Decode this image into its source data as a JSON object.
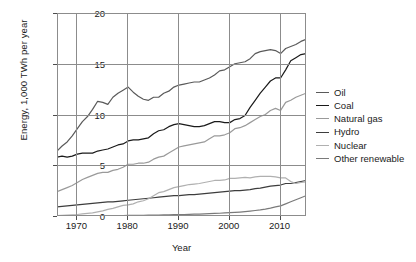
{
  "chart_data": {
    "type": "line",
    "title": "",
    "xlabel": "Year",
    "ylabel": "Energy, 1,000 TWh per year",
    "xlim": [
      1965,
      2014
    ],
    "ylim": [
      0,
      20
    ],
    "xticks": [
      1970,
      1980,
      1990,
      2000,
      2010
    ],
    "yticks": [
      0,
      5,
      10,
      15,
      20
    ],
    "grid": true,
    "legend_position": "right",
    "x": [
      1965,
      1966,
      1967,
      1968,
      1969,
      1970,
      1971,
      1972,
      1973,
      1974,
      1975,
      1976,
      1977,
      1978,
      1979,
      1980,
      1981,
      1982,
      1983,
      1984,
      1985,
      1986,
      1987,
      1988,
      1989,
      1990,
      1991,
      1992,
      1993,
      1994,
      1995,
      1996,
      1997,
      1998,
      1999,
      2000,
      2001,
      2002,
      2003,
      2004,
      2005,
      2006,
      2007,
      2008,
      2009,
      2010,
      2011,
      2012,
      2013,
      2014
    ],
    "series": [
      {
        "name": "Oil",
        "color": "#5a5a5a",
        "values": [
          6.4,
          6.9,
          7.3,
          7.9,
          8.6,
          9.3,
          9.8,
          10.5,
          11.3,
          11.2,
          11.0,
          11.7,
          12.1,
          12.4,
          12.7,
          12.2,
          11.8,
          11.5,
          11.4,
          11.7,
          11.7,
          12.1,
          12.3,
          12.7,
          12.9,
          13.0,
          13.1,
          13.2,
          13.2,
          13.4,
          13.6,
          13.9,
          14.3,
          14.4,
          14.7,
          15.0,
          15.1,
          15.2,
          15.5,
          16.0,
          16.2,
          16.3,
          16.4,
          16.3,
          16.0,
          16.5,
          16.7,
          16.9,
          17.2,
          17.4
        ]
      },
      {
        "name": "Coal",
        "color": "#1a1a1a",
        "values": [
          5.8,
          5.9,
          5.8,
          5.9,
          6.1,
          6.2,
          6.2,
          6.2,
          6.4,
          6.5,
          6.6,
          6.8,
          7.0,
          7.1,
          7.4,
          7.5,
          7.5,
          7.6,
          7.7,
          8.1,
          8.4,
          8.5,
          8.8,
          9.0,
          9.1,
          9.0,
          8.9,
          8.8,
          8.8,
          8.9,
          9.1,
          9.3,
          9.3,
          9.2,
          9.2,
          9.5,
          9.6,
          9.9,
          10.7,
          11.4,
          12.1,
          12.7,
          13.3,
          13.6,
          13.6,
          14.4,
          15.3,
          15.6,
          15.9,
          16.0
        ]
      },
      {
        "name": "Natural gas",
        "color": "#9a9a9a",
        "values": [
          2.4,
          2.6,
          2.8,
          3.0,
          3.3,
          3.6,
          3.8,
          4.0,
          4.2,
          4.3,
          4.3,
          4.5,
          4.6,
          4.8,
          5.1,
          5.1,
          5.2,
          5.2,
          5.3,
          5.6,
          5.8,
          5.9,
          6.2,
          6.5,
          6.8,
          6.9,
          7.0,
          7.1,
          7.2,
          7.3,
          7.6,
          7.9,
          7.9,
          8.0,
          8.2,
          8.6,
          8.7,
          8.9,
          9.2,
          9.5,
          9.8,
          10.0,
          10.4,
          10.6,
          10.4,
          11.2,
          11.4,
          11.7,
          11.9,
          12.1
        ]
      },
      {
        "name": "Hydro",
        "color": "#3d3d3d",
        "values": [
          0.9,
          0.95,
          1.0,
          1.05,
          1.1,
          1.15,
          1.2,
          1.25,
          1.3,
          1.35,
          1.4,
          1.4,
          1.45,
          1.5,
          1.55,
          1.6,
          1.65,
          1.7,
          1.75,
          1.8,
          1.85,
          1.9,
          1.95,
          2.0,
          2.0,
          2.05,
          2.1,
          2.1,
          2.15,
          2.2,
          2.25,
          2.3,
          2.35,
          2.4,
          2.45,
          2.5,
          2.5,
          2.55,
          2.6,
          2.7,
          2.75,
          2.85,
          2.95,
          3.0,
          3.05,
          3.2,
          3.2,
          3.3,
          3.4,
          3.5
        ]
      },
      {
        "name": "Nuclear",
        "color": "#b0b0b0",
        "values": [
          0.05,
          0.07,
          0.09,
          0.12,
          0.15,
          0.2,
          0.25,
          0.3,
          0.4,
          0.5,
          0.65,
          0.75,
          0.9,
          1.05,
          1.1,
          1.2,
          1.4,
          1.5,
          1.7,
          2.0,
          2.3,
          2.4,
          2.6,
          2.8,
          2.9,
          3.0,
          3.1,
          3.15,
          3.2,
          3.3,
          3.4,
          3.5,
          3.5,
          3.55,
          3.7,
          3.7,
          3.75,
          3.8,
          3.75,
          3.85,
          3.9,
          3.9,
          3.9,
          3.85,
          3.75,
          3.75,
          3.4,
          3.2,
          3.3,
          3.35
        ]
      },
      {
        "name": "Other renewable",
        "color": "#7a7a7a",
        "values": [
          0.02,
          0.02,
          0.02,
          0.02,
          0.03,
          0.03,
          0.03,
          0.03,
          0.04,
          0.04,
          0.04,
          0.05,
          0.05,
          0.05,
          0.06,
          0.06,
          0.07,
          0.07,
          0.08,
          0.09,
          0.1,
          0.11,
          0.12,
          0.13,
          0.14,
          0.15,
          0.16,
          0.18,
          0.19,
          0.21,
          0.23,
          0.25,
          0.27,
          0.3,
          0.33,
          0.36,
          0.39,
          0.43,
          0.48,
          0.54,
          0.6,
          0.68,
          0.78,
          0.9,
          1.0,
          1.2,
          1.4,
          1.6,
          1.8,
          2.0
        ]
      }
    ]
  },
  "axes": {
    "ylabel": "Energy, 1,000 TWh per year",
    "xlabel": "Year",
    "yticks": [
      "0",
      "5",
      "10",
      "15",
      "20"
    ],
    "xticks": [
      "1970",
      "1980",
      "1990",
      "2000",
      "2010"
    ]
  },
  "legend": {
    "items": [
      {
        "label": "Oil"
      },
      {
        "label": "Coal"
      },
      {
        "label": "Natural gas"
      },
      {
        "label": "Hydro"
      },
      {
        "label": "Nuclear"
      },
      {
        "label": "Other renewable"
      }
    ]
  }
}
